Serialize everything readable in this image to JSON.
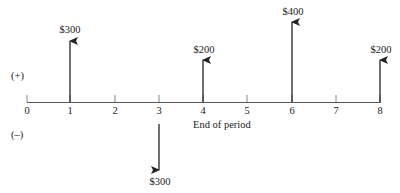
{
  "diagram": {
    "type": "cash-flow-diagram",
    "sign_labels": {
      "positive": "(+)",
      "negative": "(–)"
    },
    "axis": {
      "label": "End of period",
      "ticks": [
        "0",
        "1",
        "2",
        "3",
        "4",
        "5",
        "6",
        "7",
        "8"
      ]
    },
    "cash_flows": [
      {
        "period": 1,
        "direction": "up",
        "amount": "$300"
      },
      {
        "period": 3,
        "direction": "down",
        "amount": "$300"
      },
      {
        "period": 4,
        "direction": "up",
        "amount": "$200"
      },
      {
        "period": 6,
        "direction": "up",
        "amount": "$400"
      },
      {
        "period": 8,
        "direction": "up",
        "amount": "$200"
      }
    ],
    "colors": {
      "line": "#222222",
      "text": "#222222"
    }
  }
}
